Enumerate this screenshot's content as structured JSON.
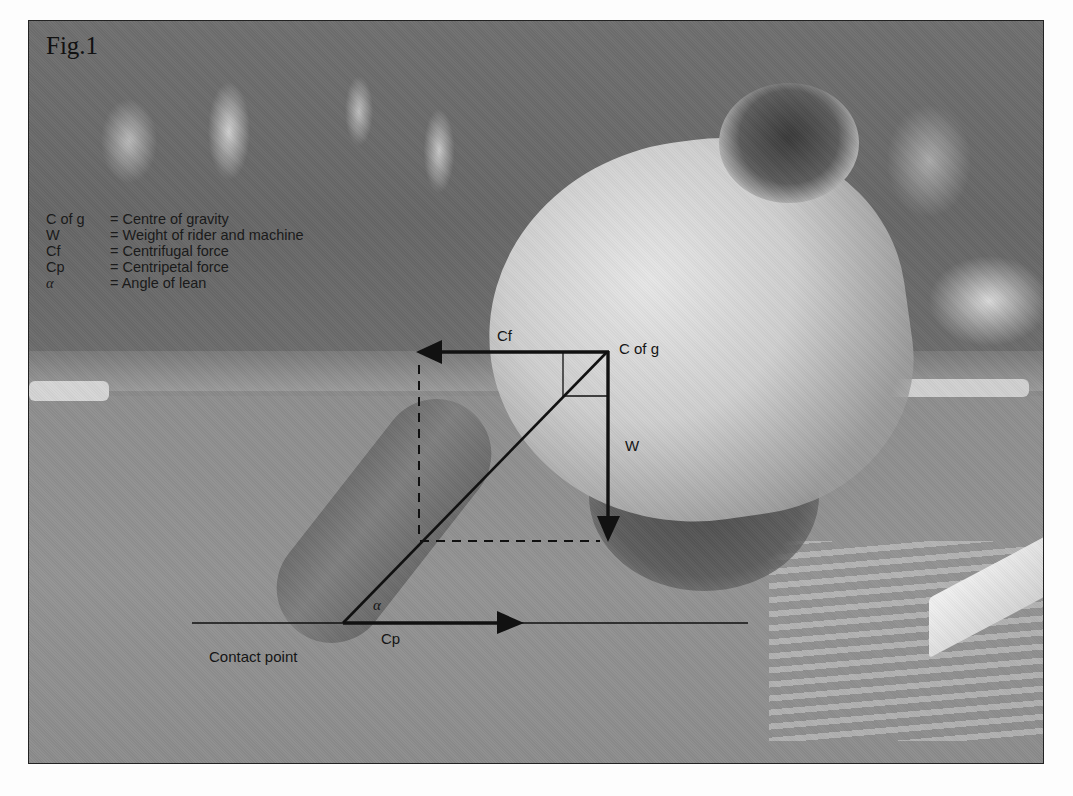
{
  "figure": {
    "title": "Fig.1"
  },
  "legend": {
    "items": [
      {
        "symbol": "C of g",
        "definition": "= Centre of gravity"
      },
      {
        "symbol": "W",
        "definition": "= Weight of rider and machine"
      },
      {
        "symbol": "Cf",
        "definition": "= Centrifugal force"
      },
      {
        "symbol": "Cp",
        "definition": "= Centripetal force"
      },
      {
        "symbol": "α",
        "definition": "= Angle of lean"
      }
    ]
  },
  "diagram": {
    "labels": {
      "centrifugal": "Cf",
      "centre_of_gravity": "C of g",
      "weight": "W",
      "angle": "α",
      "centripetal": "Cp",
      "contact_point": "Contact point"
    },
    "colors": {
      "line": "#111111",
      "frame": "#222222"
    }
  }
}
